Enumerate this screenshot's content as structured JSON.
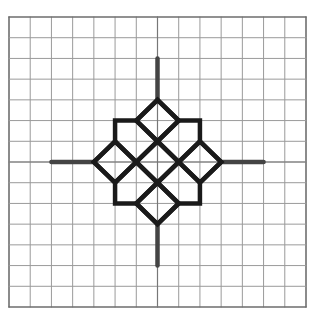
{
  "figure": {
    "grid": {
      "columns": 14,
      "rows": 14,
      "line_color": "#9a9a9a",
      "border_color": "#6e6e6e",
      "left": 9,
      "top": 17,
      "right": 306,
      "bottom": 307
    },
    "center": {
      "x": 0,
      "y": 0
    },
    "axes_segments": [
      {
        "name": "vertical-top",
        "from": [
          0,
          -5
        ],
        "to": [
          0,
          -3
        ]
      },
      {
        "name": "vertical-bottom",
        "from": [
          0,
          3
        ],
        "to": [
          0,
          5
        ]
      },
      {
        "name": "horizontal-left",
        "from": [
          -5,
          0
        ],
        "to": [
          -3,
          0
        ]
      },
      {
        "name": "horizontal-right",
        "from": [
          3,
          0
        ],
        "to": [
          5,
          0
        ]
      }
    ],
    "pattern_color": "#1a1a1a",
    "axis_color": "#444444"
  }
}
